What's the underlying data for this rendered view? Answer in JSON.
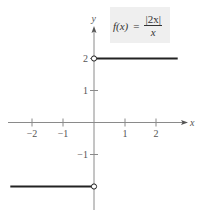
{
  "chart_data": {
    "type": "line",
    "formula": {
      "lhs": "f(x)",
      "equals": "=",
      "numerator": "|2x|",
      "denominator": "x"
    },
    "xlabel": "x",
    "ylabel": "y",
    "x_ticks": [
      -2,
      -1,
      1,
      2
    ],
    "y_ticks": [
      -1,
      1,
      2
    ],
    "x_tick_labels": [
      "−2",
      "−1",
      "1",
      "2"
    ],
    "y_tick_labels": [
      "−1",
      "1",
      "2"
    ],
    "xlim": [
      -2.7,
      2.9
    ],
    "ylim": [
      -2.7,
      3.0
    ],
    "grid": false,
    "series": [
      {
        "name": "x < 0",
        "x": [
          -2.7,
          0
        ],
        "y": [
          -2,
          -2
        ],
        "endpoint_open": [
          false,
          true
        ]
      },
      {
        "name": "x > 0",
        "x": [
          0,
          2.7
        ],
        "y": [
          2,
          2
        ],
        "endpoint_open": [
          true,
          false
        ]
      }
    ],
    "open_points": [
      {
        "x": 0,
        "y": 2
      },
      {
        "x": 0,
        "y": -2
      }
    ]
  },
  "colors": {
    "axis": "#8a8a8a",
    "curve": "#222222",
    "formula_bg": "#efefef"
  }
}
